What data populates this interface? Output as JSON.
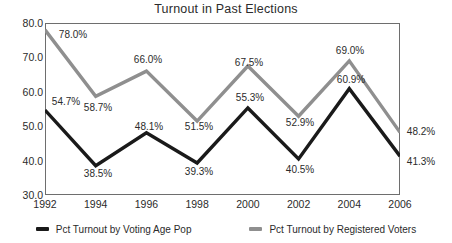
{
  "chart_data": {
    "type": "line",
    "title": "Turnout in Past Elections",
    "xlabel": "",
    "ylabel": "",
    "categories": [
      "1992",
      "1994",
      "1996",
      "1998",
      "2000",
      "2002",
      "2004",
      "2006"
    ],
    "ylim": [
      30.0,
      80.0
    ],
    "yticks": [
      "30.0",
      "40.0",
      "50.0",
      "60.0",
      "70.0",
      "80.0"
    ],
    "grid": false,
    "legend_position": "bottom",
    "series": [
      {
        "name": "Pct Turnout by Voting Age Pop",
        "color": "#1a1a1a",
        "values": [
          54.7,
          38.5,
          48.1,
          39.3,
          55.3,
          40.5,
          60.9,
          41.3
        ],
        "labels": [
          "54.7%",
          "38.5%",
          "48.1%",
          "39.3%",
          "55.3%",
          "40.5%",
          "60.9%",
          "41.3%"
        ]
      },
      {
        "name": "Pct Turnout by Registered Voters",
        "color": "#8f8f8f",
        "values": [
          78.0,
          58.7,
          66.0,
          51.5,
          67.5,
          52.9,
          69.0,
          48.2
        ],
        "labels": [
          "78.0%",
          "58.7%",
          "66.0%",
          "51.5%",
          "67.5%",
          "52.9%",
          "69.0%",
          "48.2%"
        ]
      }
    ]
  }
}
